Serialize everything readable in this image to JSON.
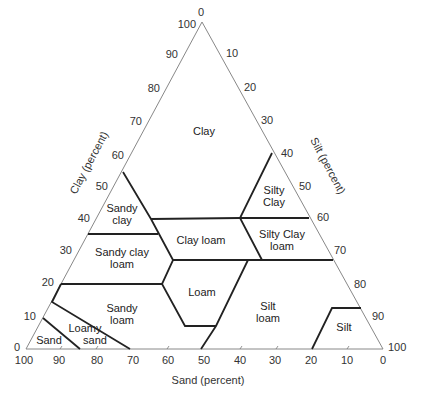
{
  "diagram": {
    "axes": {
      "clay": {
        "title": "Clay (percent)",
        "ticks": [
          "100",
          "90",
          "80",
          "70",
          "60",
          "50",
          "40",
          "30",
          "20",
          "10",
          "0"
        ]
      },
      "silt": {
        "title": "Silt (percent)",
        "ticks": [
          "0",
          "10",
          "20",
          "30",
          "40",
          "50",
          "60",
          "70",
          "80",
          "90",
          "100"
        ]
      },
      "sand": {
        "title": "Sand (percent)",
        "ticks": [
          "100",
          "90",
          "80",
          "70",
          "60",
          "50",
          "40",
          "30",
          "20",
          "10",
          "0"
        ]
      }
    },
    "regions": [
      {
        "name": "Clay",
        "lines": [
          "Clay"
        ]
      },
      {
        "name": "Silty Clay",
        "lines": [
          "Silty",
          "Clay"
        ]
      },
      {
        "name": "Sandy clay",
        "lines": [
          "Sandy",
          "clay"
        ]
      },
      {
        "name": "Clay loam",
        "lines": [
          "Clay loam"
        ]
      },
      {
        "name": "Silty Clay loam",
        "lines": [
          "Silty Clay",
          "loam"
        ]
      },
      {
        "name": "Sandy clay loam",
        "lines": [
          "Sandy clay",
          "loam"
        ]
      },
      {
        "name": "Loam",
        "lines": [
          "Loam"
        ]
      },
      {
        "name": "Sandy loam",
        "lines": [
          "Sandy",
          "loam"
        ]
      },
      {
        "name": "Silt loam",
        "lines": [
          "Silt",
          "loam"
        ]
      },
      {
        "name": "Loamy sand",
        "lines": [
          "Loamy",
          "sand"
        ]
      },
      {
        "name": "Sand",
        "lines": [
          "Sand"
        ]
      },
      {
        "name": "Silt",
        "lines": [
          "Silt"
        ]
      }
    ]
  }
}
